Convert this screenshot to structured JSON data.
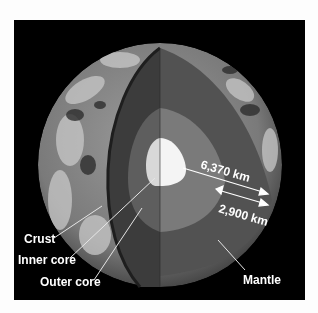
{
  "diagram": {
    "labels": {
      "crust": "Crust",
      "inner_core": "Inner core",
      "outer_core": "Outer core",
      "mantle": "Mantle"
    },
    "dimensions": {
      "radius": "6,370 km",
      "mantle_thickness": "2,900 km"
    },
    "colors": {
      "background": "#000000",
      "page": "#fdfdfd",
      "mantle_left": "#3c3c3c",
      "mantle_right": "#525252",
      "outer_core_left": "#5e5e5e",
      "outer_core_right": "#7a7a7a",
      "inner_core_left": "#d8d8d8",
      "inner_core_right": "#f4f4f4",
      "label": "#ffffff"
    }
  }
}
